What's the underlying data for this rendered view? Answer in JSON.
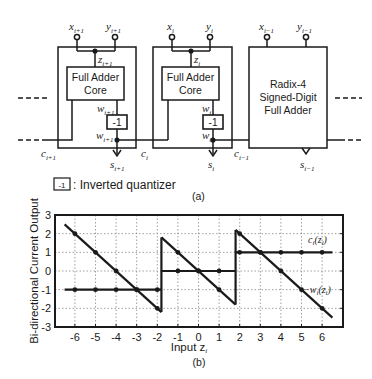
{
  "diagram": {
    "panel_label": "(a)",
    "blocks": [
      {
        "id": "block-i-plus-1",
        "input_x": "x",
        "input_x_sub": "i+1",
        "input_y": "y",
        "input_y_sub": "i+1",
        "z_label": "z",
        "z_sub": "i+1",
        "core_line1": "Full Adder",
        "core_line2": "Core",
        "w_label": "w",
        "w_sub": "i+1",
        "quantizer_label": "-1",
        "w2_label": "w",
        "w2_sub": "i+1",
        "carry_label": "c",
        "carry_sub": "i+1",
        "sum_label": "s",
        "sum_sub": "i+1"
      },
      {
        "id": "block-i",
        "input_x": "x",
        "input_x_sub": "i",
        "input_y": "y",
        "input_y_sub": "i",
        "z_label": "z",
        "z_sub": "i",
        "core_line1": "Full Adder",
        "core_line2": "Core",
        "w_label": "w",
        "w_sub": "i",
        "quantizer_label": "-1",
        "w2_label": "w",
        "w2_sub": "i",
        "carry_label": "c",
        "carry_sub": "i",
        "sum_label": "s",
        "sum_sub": "i"
      },
      {
        "id": "block-i-minus-1",
        "input_x": "x",
        "input_x_sub": "i−1",
        "input_y": "y",
        "input_y_sub": "i−1",
        "title_line1": "Radix-4",
        "title_line2": "Signed-Digit",
        "title_line3": "Full Adder",
        "carry_label": "c",
        "carry_sub": "i−1",
        "sum_label": "s",
        "sum_sub": "i−1"
      }
    ],
    "legend": {
      "symbol": "-1",
      "text": ": Inverted quantizer"
    }
  },
  "chart_data": {
    "type": "line",
    "panel_label": "(b)",
    "title": "",
    "xlabel": "Input z",
    "xlabel_sub": "i",
    "ylabel": "Bi-directional Current Output",
    "xlim": [
      -6.8,
      7.2
    ],
    "ylim": [
      -3,
      3
    ],
    "xticks": [
      "-6",
      "-5",
      "-4",
      "-3",
      "-2",
      "-1",
      "0",
      "1",
      "2",
      "3",
      "4",
      "5",
      "6"
    ],
    "yticks": [
      "3",
      "2",
      "1",
      "0",
      "-1",
      "-2",
      "-3"
    ],
    "grid": true,
    "series": [
      {
        "name": "c_i(z_i)",
        "label": "c",
        "label_tail": "(z",
        "label_sub": "i",
        "label_close": ")",
        "segments": [
          {
            "x": [
              -6.5,
              -1.8
            ],
            "y": [
              -1,
              -1
            ]
          },
          {
            "x": [
              -1.8,
              1.8
            ],
            "y": [
              0,
              0
            ]
          },
          {
            "x": [
              1.8,
              6.5
            ],
            "y": [
              1,
              1
            ]
          }
        ],
        "markers": [
          [
            -6,
            -1
          ],
          [
            -5,
            -1
          ],
          [
            -4,
            -1
          ],
          [
            -3,
            -1
          ],
          [
            -2,
            -1
          ],
          [
            -1,
            0
          ],
          [
            0,
            0
          ],
          [
            1,
            0
          ],
          [
            2,
            1
          ],
          [
            3,
            1
          ],
          [
            4,
            1
          ],
          [
            5,
            1
          ],
          [
            6,
            1
          ]
        ]
      },
      {
        "name": "-w_i(z_i)",
        "label": "−w",
        "label_tail": "(z",
        "label_sub": "i",
        "label_close": ")",
        "segments": [
          {
            "x": [
              -6.5,
              -1.8
            ],
            "y": [
              2.5,
              -2.2
            ]
          },
          {
            "x": [
              -1.8,
              -1.8
            ],
            "y": [
              -2.2,
              1.8
            ]
          },
          {
            "x": [
              -1.8,
              1.8
            ],
            "y": [
              1.8,
              -1.8
            ]
          },
          {
            "x": [
              1.8,
              1.8
            ],
            "y": [
              -1.8,
              2.2
            ]
          },
          {
            "x": [
              1.8,
              6.5
            ],
            "y": [
              2.2,
              -2.5
            ]
          }
        ],
        "markers": [
          [
            -6,
            2
          ],
          [
            -5,
            1
          ],
          [
            -4,
            0
          ],
          [
            -3,
            -1
          ],
          [
            -2,
            -2
          ],
          [
            -1,
            1
          ],
          [
            0,
            0
          ],
          [
            1,
            -1
          ],
          [
            2,
            2
          ],
          [
            3,
            1
          ],
          [
            4,
            0
          ],
          [
            5,
            -1
          ],
          [
            6,
            -2
          ]
        ]
      }
    ]
  }
}
